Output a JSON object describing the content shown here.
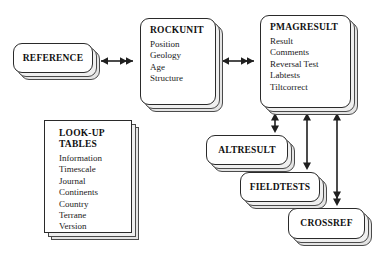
{
  "diagram": {
    "style": {
      "line_color": "#2a2a2a",
      "node_fill": "#ffffff",
      "sheet_fill": "#efefef",
      "text_color": "#111111"
    },
    "nodes": [
      {
        "id": "reference",
        "label": "REFERENCE",
        "shape": "rounded-pill",
        "fields": [],
        "x": 13,
        "y": 43,
        "w": 80,
        "h": 30
      },
      {
        "id": "rockunit",
        "label": "ROCKUNIT",
        "shape": "rounded-panel",
        "fields": [
          "Position",
          "Geology",
          "Age",
          "Structure"
        ],
        "x": 140,
        "y": 18,
        "w": 76,
        "h": 87
      },
      {
        "id": "pmagresult",
        "label": "PMAGRESULT",
        "shape": "rounded-panel",
        "fields": [
          "Result",
          "Comments",
          "Reversal Test",
          "Labtests",
          "Tiltcorrect"
        ],
        "x": 260,
        "y": 15,
        "w": 91,
        "h": 93
      },
      {
        "id": "lookup-tables",
        "label": "LOOK-UP\nTABLES",
        "shape": "square-panel",
        "fields": [
          "Information",
          "Timescale",
          "Journal",
          "Continents",
          "Country",
          "Terrane",
          "Version"
        ],
        "x": 44,
        "y": 120,
        "w": 88,
        "h": 113
      },
      {
        "id": "altresult",
        "label": "ALTRESULT",
        "shape": "rounded-pill",
        "fields": [],
        "x": 206,
        "y": 135,
        "w": 82,
        "h": 30
      },
      {
        "id": "fieldtests",
        "label": "FIELDTESTS",
        "shape": "rounded-pill",
        "fields": [],
        "x": 240,
        "y": 172,
        "w": 80,
        "h": 30
      },
      {
        "id": "crossref",
        "label": "CROSSREF",
        "shape": "rounded-pill",
        "fields": [],
        "x": 288,
        "y": 208,
        "w": 77,
        "h": 31
      }
    ],
    "connections": [
      {
        "id": "reference-rockunit",
        "from": "reference",
        "to": "rockunit",
        "orientation": "horizontal",
        "arrowheads": "both"
      },
      {
        "id": "rockunit-pmagresult",
        "from": "rockunit",
        "to": "pmagresult",
        "orientation": "horizontal",
        "arrowheads": "both"
      },
      {
        "id": "pmagresult-altresult",
        "from": "pmagresult",
        "to": "altresult",
        "orientation": "vertical",
        "arrowheads": "both"
      },
      {
        "id": "pmagresult-fieldtests",
        "from": "pmagresult",
        "to": "fieldtests",
        "orientation": "vertical",
        "arrowheads": "both"
      },
      {
        "id": "pmagresult-crossref",
        "from": "pmagresult",
        "to": "crossref",
        "orientation": "vertical",
        "arrowheads": "both"
      }
    ]
  }
}
